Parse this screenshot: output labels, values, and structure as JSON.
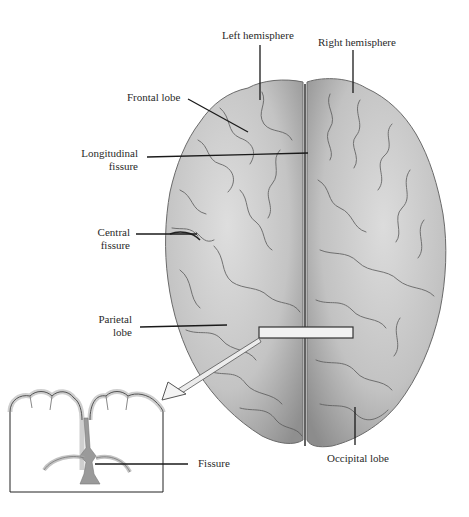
{
  "diagram": {
    "labels": {
      "left_hemisphere": "Left hemisphere",
      "right_hemisphere": "Right hemisphere",
      "frontal_lobe": "Frontal lobe",
      "longitudinal_fissure_line1": "Longitudinal",
      "longitudinal_fissure_line2": "fissure",
      "central_fissure_line1": "Central",
      "central_fissure_line2": "fissure",
      "parietal_lobe_line1": "Parietal",
      "parietal_lobe_line2": "lobe",
      "occipital_lobe": "Occipital lobe",
      "fissure": "Fissure"
    },
    "colors": {
      "brain_fill": "#c9c9c9",
      "brain_shadow": "#8a8a8a",
      "sulcus": "#555555",
      "leader_line": "#1a1a1a",
      "highlight_box": "#f2f2f2",
      "inset_gray_matter": "#cfcfcf",
      "inset_fissure": "#9a9a9a"
    }
  }
}
